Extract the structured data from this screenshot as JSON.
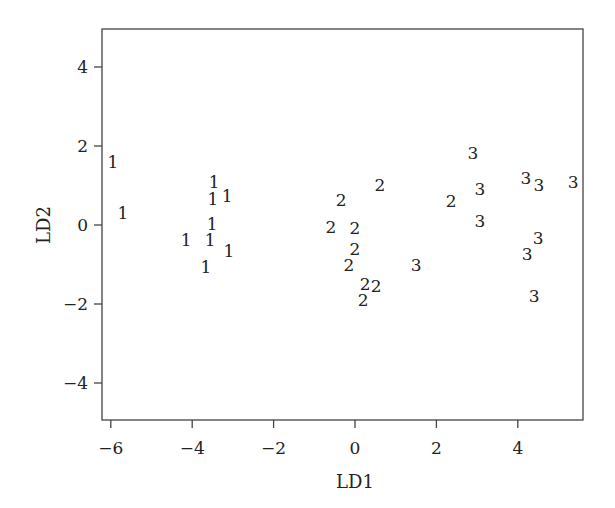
{
  "chart_data": {
    "type": "scatter",
    "title": "",
    "xlabel": "LD1",
    "ylabel": "LD2",
    "xlim": [
      -6.2,
      5.6
    ],
    "ylim": [
      -5,
      5
    ],
    "xticks": [
      -6,
      -4,
      -2,
      0,
      2,
      4
    ],
    "yticks": [
      -4,
      -2,
      0,
      2,
      4
    ],
    "grid": false,
    "legend": null,
    "marker": "group label text",
    "series": [
      {
        "name": "1",
        "points": [
          [
            -5.95,
            1.6
          ],
          [
            -5.7,
            0.3
          ],
          [
            -3.46,
            1.09
          ],
          [
            -3.49,
            0.66
          ],
          [
            -3.14,
            0.73
          ],
          [
            -3.51,
            0.03
          ],
          [
            -4.15,
            -0.38
          ],
          [
            -3.56,
            -0.38
          ],
          [
            -3.1,
            -0.66
          ],
          [
            -3.66,
            -1.06
          ]
        ]
      },
      {
        "name": "2",
        "points": [
          [
            0.61,
            1.01
          ],
          [
            -0.34,
            0.63
          ],
          [
            -0.59,
            -0.05
          ],
          [
            0.0,
            -0.08
          ],
          [
            0.0,
            -0.61
          ],
          [
            -0.15,
            -1.01
          ],
          [
            0.25,
            -1.49
          ],
          [
            0.52,
            -1.54
          ],
          [
            0.2,
            -1.9
          ],
          [
            2.36,
            0.61
          ]
        ]
      },
      {
        "name": "3",
        "points": [
          [
            2.9,
            1.82
          ],
          [
            3.07,
            0.91
          ],
          [
            4.2,
            1.19
          ],
          [
            4.52,
            1.01
          ],
          [
            5.36,
            1.09
          ],
          [
            3.07,
            0.1
          ],
          [
            4.5,
            -0.33
          ],
          [
            4.23,
            -0.73
          ],
          [
            1.5,
            -1.01
          ],
          [
            4.4,
            -1.8
          ]
        ]
      }
    ]
  },
  "layout": {
    "plot_left": 102,
    "plot_right": 583,
    "plot_top": 29,
    "plot_bottom": 420,
    "x_zero_px": 355,
    "x_unit_px": 40.7,
    "y_zero_px": 225,
    "y_unit_px": 39.5,
    "axis_color": "#444444"
  }
}
